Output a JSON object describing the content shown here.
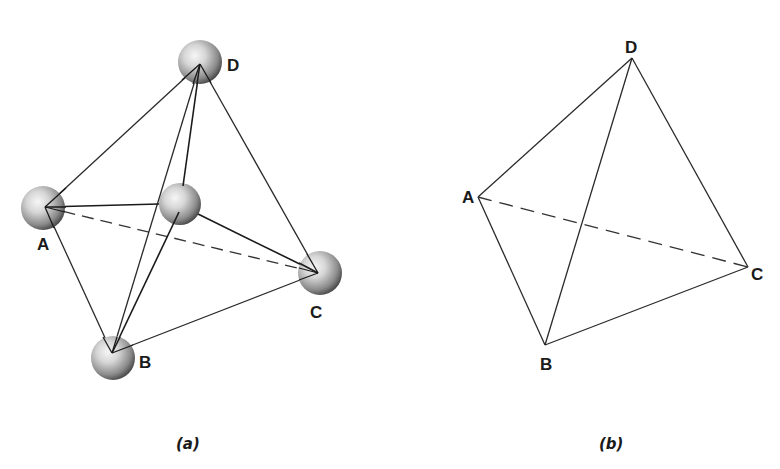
{
  "figure": {
    "panels": [
      {
        "id": "a",
        "caption": "(a)",
        "type": "ball-and-stick tetrahedron",
        "vertices": [
          {
            "label": "A",
            "x": 45,
            "y": 207
          },
          {
            "label": "B",
            "x": 112,
            "y": 353
          },
          {
            "label": "C",
            "x": 318,
            "y": 273
          },
          {
            "label": "D",
            "x": 200,
            "y": 64
          }
        ],
        "center_atom": {
          "label": "",
          "x": 180,
          "y": 204
        },
        "solid_edges": [
          "A-D",
          "A-B",
          "B-C",
          "C-D",
          "B-D"
        ],
        "dashed_edges": [
          "A-C"
        ],
        "center_bonds": [
          "center-A",
          "center-B",
          "center-C",
          "center-D"
        ]
      },
      {
        "id": "b",
        "caption": "(b)",
        "type": "wireframe tetrahedron",
        "vertices": [
          {
            "label": "A",
            "x": 478,
            "y": 197
          },
          {
            "label": "B",
            "x": 545,
            "y": 345
          },
          {
            "label": "C",
            "x": 748,
            "y": 267
          },
          {
            "label": "D",
            "x": 632,
            "y": 58
          }
        ],
        "solid_edges": [
          "A-D",
          "A-B",
          "B-C",
          "C-D",
          "B-D"
        ],
        "dashed_edges": [
          "A-C"
        ]
      }
    ]
  },
  "labels": {
    "a": {
      "A": "A",
      "B": "B",
      "C": "C",
      "D": "D",
      "caption": "(a)"
    },
    "b": {
      "A": "A",
      "B": "B",
      "C": "C",
      "D": "D",
      "caption": "(b)"
    }
  },
  "colors": {
    "line": "#2a2a2a",
    "sphere_light": "#f4f4f4",
    "sphere_dark": "#3a3a3a",
    "background": "#ffffff"
  }
}
